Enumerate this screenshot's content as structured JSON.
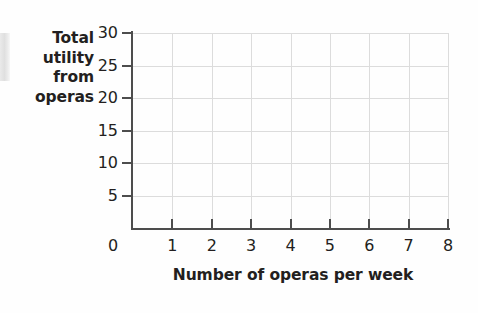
{
  "chart_data": {
    "type": "line",
    "title": "",
    "subtitle": "",
    "xlabel": "Number of operas per week",
    "ylabel": "Total utility from operas",
    "ylabel_lines": [
      "Total",
      "utility",
      "from",
      "operas"
    ],
    "xlim": [
      0,
      8
    ],
    "ylim": [
      0,
      30
    ],
    "xticks": [
      0,
      1,
      2,
      3,
      4,
      5,
      6,
      7,
      8
    ],
    "xtick_labels": [
      "0",
      "1",
      "2",
      "3",
      "4",
      "5",
      "6",
      "7",
      "8"
    ],
    "yticks": [
      5,
      10,
      15,
      20,
      25,
      30
    ],
    "ytick_labels": [
      "5",
      "10",
      "15",
      "20",
      "25",
      "30"
    ],
    "grid": true,
    "grid_color": "#dcdcdc",
    "axis_color": "#4d4d4d",
    "background": "#fefefe",
    "legend": null,
    "series": [],
    "values": [],
    "annotations": [],
    "note": "empty grid — no data plotted"
  },
  "colors": {
    "axis": "#4d4d4d",
    "grid": "#dcdcdc",
    "text": "#231f20",
    "background": "#fefefe",
    "artifact": "#dedede"
  }
}
